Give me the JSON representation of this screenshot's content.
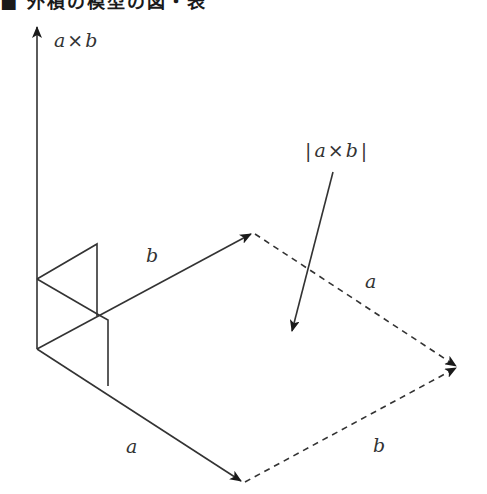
{
  "title": {
    "text": "■ 外積の模型の図・表",
    "note": "heading cropped at top edge; only bottom strokes visible"
  },
  "diagram": {
    "colors": {
      "line": "#333333",
      "background": "#ffffff"
    },
    "labels": {
      "cross_axis": {
        "var1": "a",
        "op": "×",
        "var2": "b"
      },
      "magnitude": {
        "bar_left": "|",
        "var1": "a",
        "op": "×",
        "var2": "b",
        "bar_right": "|"
      },
      "b_vector": "b",
      "a_dashed": "a",
      "a_vector": "a",
      "b_dashed": "b"
    },
    "points": {
      "origin": [
        37,
        349
      ],
      "cross_tip": [
        37,
        25
      ],
      "a_tip": [
        243,
        482
      ],
      "b_tip": [
        253,
        233
      ],
      "far_corner": [
        458,
        367
      ],
      "pointer_start": [
        333,
        172
      ],
      "pointer_tip": [
        291,
        333
      ]
    }
  }
}
